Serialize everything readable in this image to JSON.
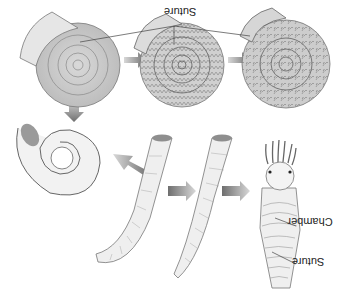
{
  "diagram": {
    "orientation": "flipped-vertically",
    "labels": {
      "top_suture": "Suture",
      "chamber": "Chamber",
      "bottom_suture": "Suture"
    },
    "stages": [
      {
        "name": "straight-nautiloid-with-animal",
        "shape": "straight cone"
      },
      {
        "name": "curved-cone-1",
        "shape": "slightly curved cone"
      },
      {
        "name": "curved-cone-2",
        "shape": "curved cone"
      },
      {
        "name": "loosely-coiled-shell",
        "shape": "open coil"
      },
      {
        "name": "goniatite",
        "shape": "coiled, simple wavy sutures"
      },
      {
        "name": "ceratite",
        "shape": "coiled, zigzag sutures"
      },
      {
        "name": "ammonite",
        "shape": "coiled, complex frilly sutures"
      }
    ],
    "colors": {
      "shell_light": "#ececec",
      "shell_mid": "#cfcfcf",
      "shell_dark": "#8a8a8a",
      "arrow": "#7a7a7a",
      "line": "#555555"
    }
  }
}
